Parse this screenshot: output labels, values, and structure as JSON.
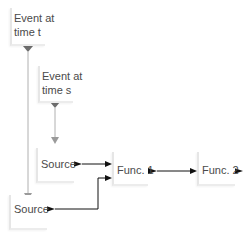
{
  "diagram": {
    "nodes": [
      {
        "id": "event_t",
        "label_line1": "Event at",
        "label_line2": "time t"
      },
      {
        "id": "event_s",
        "label_line1": "Event at",
        "label_line2": "time s"
      },
      {
        "id": "source_upper",
        "label": "Source"
      },
      {
        "id": "source_lower",
        "label": "Source"
      },
      {
        "id": "func1",
        "label": "Func. 1"
      },
      {
        "id": "func2",
        "label": "Func. 2"
      }
    ],
    "edges": [
      {
        "from": "event_t",
        "to": "source_lower",
        "style": "gray"
      },
      {
        "from": "event_s",
        "to": "source_upper",
        "style": "gray"
      },
      {
        "from": "source_upper",
        "to": "func1",
        "style": "black"
      },
      {
        "from": "source_lower",
        "to": "func1",
        "style": "black"
      },
      {
        "from": "func1",
        "to": "func2",
        "style": "black"
      }
    ],
    "colors": {
      "gray_edge": "#a8a8a8",
      "black_edge": "#111111",
      "text": "#4a4a4a"
    }
  }
}
